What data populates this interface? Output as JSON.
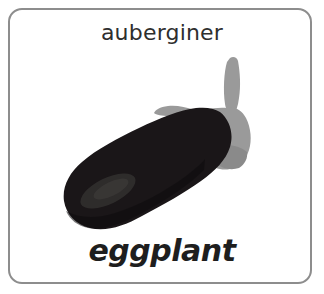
{
  "card": {
    "border_color": "#8d8d8d",
    "background_color": "#ffffff",
    "corner_radius_px": 14
  },
  "word_top": {
    "text": "auberginer",
    "language": "Swedish",
    "color": "#2e2e2e"
  },
  "word_bottom": {
    "text": "eggplant",
    "language": "English",
    "color": "#1e1e1e"
  },
  "illustration": {
    "subject": "eggplant",
    "alt_text": "eggplant",
    "body_color": "#1a1618",
    "body_shadow_color": "#0d0b0c",
    "highlight_color": "#33302f",
    "stem_color": "#9a9a9a",
    "stem_shadow_color": "#8a8a8a"
  }
}
